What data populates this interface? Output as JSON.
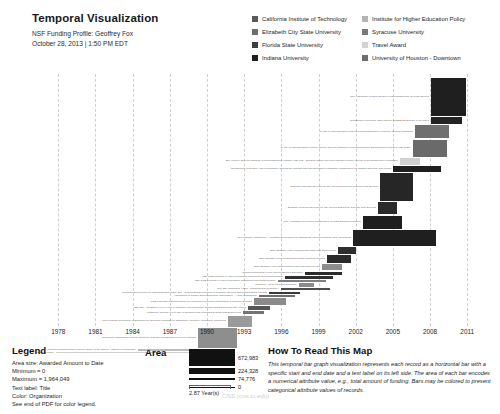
{
  "header": {
    "title": "Temporal Visualization",
    "profile_line": "NSF Funding Profile: Geoffrey Fox",
    "timestamp_line": "October 28, 2013 | 1:50 PM EDT"
  },
  "color_legend": {
    "items": [
      {
        "label": "California Institute of Technology",
        "color": "#5a5a5a"
      },
      {
        "label": "Institute for Higher Education Policy",
        "color": "#b4b4b4"
      },
      {
        "label": "Elizabeth City State University",
        "color": "#6e6e6e"
      },
      {
        "label": "Syracuse University",
        "color": "#787878"
      },
      {
        "label": "Florida State University",
        "color": "#3c3c3c"
      },
      {
        "label": "Travel Award",
        "color": "#d2d2d2"
      },
      {
        "label": "Indiana University",
        "color": "#1f1f1f"
      },
      {
        "label": "University of Houston - Downtown",
        "color": "#6e6e6e"
      }
    ]
  },
  "legend_block": {
    "heading": "Legend",
    "lines": [
      "Area size: Awarded Amount to Date",
      "Minimum = 0",
      "Maximum = 1,964,049",
      "Text label: Title",
      "Color: Organization",
      "See end of PDF for color legend."
    ]
  },
  "area_block": {
    "heading": "Area",
    "chips": [
      {
        "value": "672,983",
        "height": 17,
        "width": 46
      },
      {
        "value": "224,328",
        "height": 6,
        "width": 46
      },
      {
        "value": "74,776",
        "height": 2,
        "width": 46
      },
      {
        "value": "0",
        "height": 1,
        "width": 46
      }
    ],
    "scale_label": "2.87 Year(s)"
  },
  "howto_block": {
    "heading": "How To Read This Map",
    "text": "This temporal bar graph visualization represents each record as a horizontal bar with a specific start and end date and a text label on its left side. The area of each bar encodes a numerical attribute value, e.g., total amount of funding. Bars may be colored to present categorical attribute values of records."
  },
  "watermark": "CNS (cns.iu.edu)",
  "chart_data": {
    "type": "bar",
    "title": "Temporal Visualization",
    "subtitle": "NSF Funding Profile: Geoffrey Fox",
    "xlabel": "",
    "ylabel": "",
    "orientation": "horizontal-gantt",
    "grid": true,
    "legend_position": "top-right",
    "xlim": [
      1976.2,
      2013.0
    ],
    "xticks": [
      1978,
      1981,
      1984,
      1987,
      1990,
      1993,
      1996,
      1999,
      2002,
      2005,
      2008,
      2011
    ],
    "size_encoding": "Awarded Amount to Date",
    "size_min": 0,
    "size_max": 1964049,
    "color_encoding": "Organization",
    "bars": [
      {
        "label": "MRI: Acquisition of Data Intensive Cyberinfrastructure for Polar Science",
        "start": 2008.1,
        "end": 2010.9,
        "color": "#1f1f1f",
        "thickness": 38,
        "amount": 1964049
      },
      {
        "label": "Collaborative Research: Open Source SciDB/Data Science in the Cloud",
        "start": 2008.1,
        "end": 2010.6,
        "color": "#232323",
        "thickness": 7,
        "amount": 520000
      },
      {
        "label": "CI-TEAM Implementation Project: Cyberinfrastructure in Minority Serving Institutions",
        "start": 2006.8,
        "end": 2009.5,
        "color": "#6f6f6f",
        "thickness": 13,
        "amount": 780000
      },
      {
        "label": "CI-TEAM Implementation Project: Minority Serving Institution CyberInfrastructure Empowerment Coalition (MSI-CIEC)",
        "start": 2006.6,
        "end": 2009.4,
        "color": "#6a6a6a",
        "thickness": 17,
        "amount": 930000
      },
      {
        "label": "SCI: Minority Serving Institution Cyberinfrastructure Institute (MSI-CI2) - Bridging Minority Serving Institution Faculty into the Cyberinfrastructure Community",
        "start": 2005.6,
        "end": 2007.2,
        "color": "#d0d0d0",
        "thickness": 7,
        "amount": 150000
      },
      {
        "label": "Collaborative Research: High Performance Techniques, Designs and Implementation of Software Infrastructure for Change Detection and Mining",
        "start": 2005.0,
        "end": 2008.9,
        "color": "#1f1f1f",
        "thickness": 6,
        "amount": 400000
      },
      {
        "label": "Semantic Grid/Web Services for CS: Internal Scaling for Grid and Web Services",
        "start": 2004.0,
        "end": 2006.6,
        "color": "#262626",
        "thickness": 28,
        "amount": 1200000
      },
      {
        "label": "Semantic Grid/Web Services for CS: Internal Scaling for Grid and Web Services",
        "start": 2003.8,
        "end": 2005.3,
        "color": "#2b2b2b",
        "thickness": 12,
        "amount": 640000
      },
      {
        "label": "MRI: Acquisition of Physical Infrastructure for Data Delta Development",
        "start": 2002.6,
        "end": 2005.7,
        "color": "#1f1f1f",
        "thickness": 13,
        "amount": 720000
      },
      {
        "label": "NMI Program Assessment: A Trustable Environment for Distributed High Performance Grid Applications",
        "start": 2001.8,
        "end": 2008.5,
        "color": "#1f1f1f",
        "thickness": 16,
        "amount": 870000
      },
      {
        "label": "Easy-Scalable HPMI Programming Model and Tools to Java",
        "start": 2000.6,
        "end": 2002.0,
        "color": "#2e2e2e",
        "thickness": 7,
        "amount": 180000
      },
      {
        "label": "Easy-Scalable HPMI Programming Model and Tools to Java",
        "start": 1999.7,
        "end": 2001.6,
        "color": "#2a2a2a",
        "thickness": 8,
        "amount": 230000
      },
      {
        "label": "Easy-Scalable HPMI Programming Model and Tools to Java",
        "start": 1999.3,
        "end": 2000.9,
        "color": "#8c8c8c",
        "thickness": 6,
        "amount": 140000
      },
      {
        "label": "Advanced Technology of the Internet Science Education",
        "start": 1997.9,
        "end": 2000.9,
        "color": "#2b2b2b",
        "thickness": 3,
        "amount": 95000
      },
      {
        "label": "NSF CISE Program in High Performance Computing and Communication",
        "start": 1996.3,
        "end": 2000.2,
        "color": "#2f2f2f",
        "thickness": 3,
        "amount": 88000
      },
      {
        "label": "NSF CISE Program in High Performance Computing and Communication",
        "start": 1995.7,
        "end": 1999.6,
        "color": "#808080",
        "thickness": 2,
        "amount": 62000
      },
      {
        "label": "Incoming: A New Model for Education",
        "start": 1997.4,
        "end": 1998.6,
        "color": "#8a8a8a",
        "thickness": 4,
        "amount": 110000
      },
      {
        "label": "RUI: Site Computing Award - Computational Research II",
        "start": 1996.0,
        "end": 1999.9,
        "color": "#4d4d4d",
        "thickness": 2,
        "amount": 70000
      },
      {
        "label": "Research Experiences for Undergraduates (REU) Site - Undergraduate Research in Computer Science and Computational Physics",
        "start": 1995.0,
        "end": 1997.5,
        "color": "#3a3a3a",
        "thickness": 2,
        "amount": 58000
      },
      {
        "label": "Applications of Parallel Supercomputing Computation - A New Methodology",
        "start": 1994.2,
        "end": 1997.1,
        "color": "#6d6d6d",
        "thickness": 2,
        "amount": 54000
      },
      {
        "label": "CISE Research Instrumentation on a Program in Physical Computation & Complex Systems",
        "start": 1993.8,
        "end": 1996.4,
        "color": "#8a8a8a",
        "thickness": 7,
        "amount": 165000
      },
      {
        "label": "REU Site - CC Edition on PVL Unit in Computer plus Secondary Studies and Engineering and Applied",
        "start": 1993.3,
        "end": 1995.1,
        "color": "#555555",
        "thickness": 4,
        "amount": 120000
      },
      {
        "label": "Parametric Centers in PVL Site in Condition and Microdata Systems and Engineering",
        "start": 1992.9,
        "end": 1994.6,
        "color": "#737373",
        "thickness": 3,
        "amount": 86000
      },
      {
        "label": "A New Program Technology in Education for Scientific Programs on Distributed Advanced Architecture Computers",
        "start": 1991.7,
        "end": 1993.6,
        "color": "#9a9a9a",
        "thickness": 11,
        "amount": 330000
      },
      {
        "label": "Concurrent Computation and the Structure of SysNet and Bouquet General Problems",
        "start": 1989.3,
        "end": 1992.4,
        "color": "#8e8e8e",
        "thickness": 20,
        "amount": 610000
      },
      {
        "label": "Advanced Communication Linking Facility of the Offices - Institute of Technology",
        "start": 1984.4,
        "end": 1990.6,
        "color": "#bcbcbc",
        "thickness": 2,
        "amount": 45000
      },
      {
        "label": "Center in Macro - Mid Cyberinfrastructure Collaboration",
        "start": 1977.8,
        "end": 1990.0,
        "color": "#cfcfcf",
        "thickness": 1,
        "amount": 20000
      }
    ]
  }
}
